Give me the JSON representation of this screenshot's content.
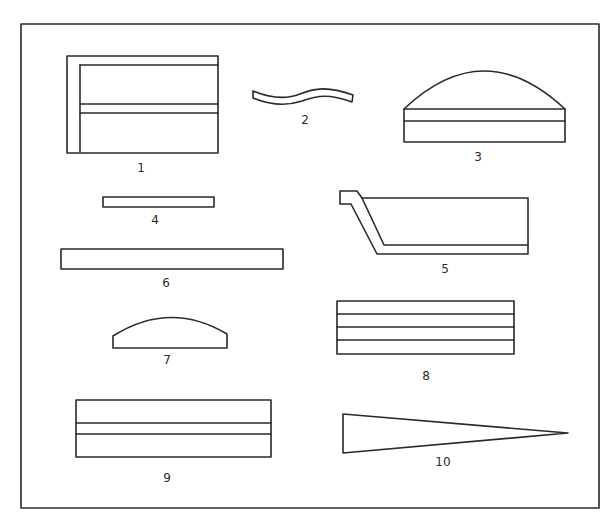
{
  "diagram": {
    "frame": {
      "x": 21,
      "y": 24,
      "width": 578,
      "height": 484
    },
    "stroke_color": "#2a2a2a",
    "background_color": "#ffffff",
    "shapes": [
      {
        "id": 1,
        "label": "1",
        "description": "rectangle with inner L-border and double horizontal band"
      },
      {
        "id": 2,
        "label": "2",
        "description": "thin wavy strip"
      },
      {
        "id": 3,
        "label": "3",
        "description": "dome atop two-layer rectangular base"
      },
      {
        "id": 4,
        "label": "4",
        "description": "thin flat bar"
      },
      {
        "id": 5,
        "label": "5",
        "description": "trough / tray profile with slanted side and lip"
      },
      {
        "id": 6,
        "label": "6",
        "description": "long flat bar"
      },
      {
        "id": 7,
        "label": "7",
        "description": "low dome segment on flat base"
      },
      {
        "id": 8,
        "label": "8",
        "description": "rectangle divided into four horizontal layers"
      },
      {
        "id": 9,
        "label": "9",
        "description": "rectangle with central double horizontal band"
      },
      {
        "id": 10,
        "label": "10",
        "description": "long tapering wedge"
      }
    ]
  }
}
